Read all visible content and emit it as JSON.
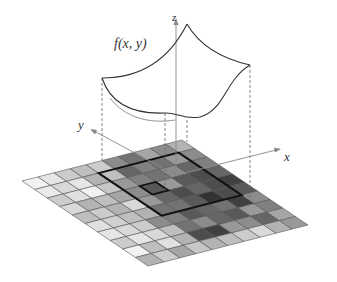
{
  "figure": {
    "function_label": "f(x, y)",
    "axes": {
      "x_label": "x",
      "y_label": "y",
      "z_label": "z"
    },
    "grid": {
      "rows": 10,
      "cols": 10,
      "corners": {
        "left": [
          22,
          181
        ],
        "top": [
          182,
          140
        ],
        "right": [
          318,
          225
        ],
        "bottom": [
          148,
          266
        ]
      },
      "shades": [
        [
          0.95,
          0.9,
          0.8,
          0.75,
          0.8,
          0.55,
          0.45,
          0.65,
          0.55,
          0.7
        ],
        [
          0.92,
          0.85,
          0.9,
          0.7,
          0.75,
          0.4,
          0.5,
          0.45,
          0.6,
          0.55
        ],
        [
          0.8,
          0.88,
          0.95,
          0.78,
          0.6,
          0.5,
          0.45,
          0.55,
          0.4,
          0.5
        ],
        [
          0.85,
          0.7,
          0.75,
          0.65,
          0.55,
          0.45,
          0.6,
          0.35,
          0.3,
          0.4
        ],
        [
          0.75,
          0.8,
          0.7,
          0.85,
          0.6,
          0.4,
          0.3,
          0.4,
          0.3,
          0.25
        ],
        [
          0.88,
          0.82,
          0.75,
          0.7,
          0.45,
          0.45,
          0.35,
          0.2,
          0.3,
          0.35
        ],
        [
          0.9,
          0.85,
          0.8,
          0.55,
          0.5,
          0.35,
          0.4,
          0.45,
          0.25,
          0.55
        ],
        [
          0.8,
          0.9,
          0.85,
          0.75,
          0.45,
          0.55,
          0.4,
          0.35,
          0.6,
          0.5
        ],
        [
          0.95,
          0.75,
          0.88,
          0.7,
          0.3,
          0.25,
          0.6,
          0.55,
          0.4,
          0.65
        ],
        [
          0.7,
          0.8,
          0.65,
          0.78,
          0.7,
          0.75,
          0.8,
          0.85,
          0.7,
          0.6
        ]
      ],
      "bold_square": {
        "row_start": 1,
        "row_end": 6,
        "col_start": 4,
        "col_end": 9
      },
      "center_square": {
        "row": 3,
        "col": 5
      }
    },
    "colors": {
      "line": "#333333",
      "axis": "#888888",
      "grid_line": "#555555"
    }
  }
}
